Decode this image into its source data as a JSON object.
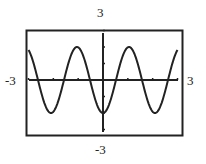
{
  "chart_data": {
    "type": "line",
    "title": "",
    "function": "y = -2cos(3x)",
    "xlim": [
      -3,
      3
    ],
    "ylim": [
      -3,
      3
    ],
    "xlabel": "",
    "ylabel": "",
    "x_ticks": [
      -3,
      -2,
      -1,
      0,
      1,
      2,
      3
    ],
    "y_ticks": [
      -3,
      -2,
      -1,
      0,
      1,
      2,
      3
    ],
    "grid": false,
    "window_labels": {
      "ymax": "3",
      "ymin": "-3",
      "xmin": "-3",
      "xmax": "3"
    },
    "series": [
      {
        "name": "y = -2cos(3x)",
        "x": [
          -3,
          -2.5,
          -2.094,
          -1.5,
          -1.047,
          -0.5,
          0,
          0.5,
          1.047,
          1.5,
          2.094,
          2.5,
          3
        ],
        "y": [
          1.82,
          -0.69,
          -2,
          0.42,
          2,
          -0.14,
          -2,
          -0.14,
          2,
          0.42,
          -2,
          -0.69,
          1.82
        ]
      }
    ],
    "stroke_color": "#222222",
    "frame_color": "#222222"
  }
}
